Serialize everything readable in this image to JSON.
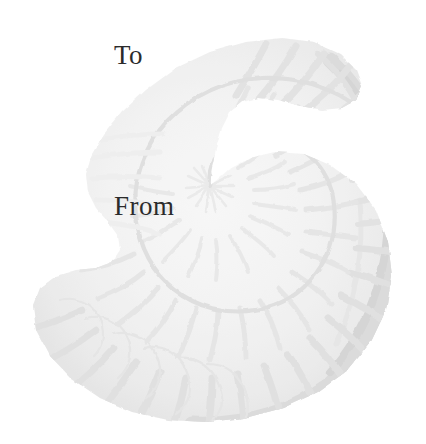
{
  "page": {
    "kind": "gift-tag",
    "width": 426,
    "height": 444,
    "background_color": "#ffffff"
  },
  "labels": {
    "to": "To",
    "from": "From",
    "text_color": "#2b2b2b"
  },
  "artwork": {
    "name": "ammonite-fossil-illustration",
    "description": "Faded watermark illustration of a coiled ammonite fossil shell",
    "palette": {
      "lightest": "#f2f2f2",
      "light": "#ececec",
      "mid": "#e2e2e2",
      "dark": "#d8d8d8",
      "darkest": "#cfcfcf"
    },
    "geometry": {
      "spiral_center_x": 210,
      "spiral_center_y": 186,
      "outer_right_x": 398,
      "outer_bottom_y": 425,
      "outer_left_x": 33,
      "outer_top_y": 28,
      "whorl_count": 3.2,
      "rib_count": 34
    }
  }
}
